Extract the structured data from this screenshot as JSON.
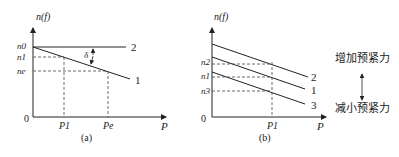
{
  "panel_a": {
    "caption": "(a)",
    "y_axis_label": "n(f)",
    "x_axis_label": "P",
    "origin_label": "0",
    "y_ticks": [
      "n0",
      "n1",
      "ne"
    ],
    "x_ticks": [
      "P1",
      "Pe"
    ],
    "lines": [
      {
        "label": "2"
      },
      {
        "label": "1"
      }
    ],
    "delta_label": "δ"
  },
  "panel_b": {
    "caption": "(b)",
    "y_axis_label": "n(f)",
    "x_axis_label": "P",
    "origin_label": "0",
    "y_ticks": [
      "n2",
      "n1",
      "n3"
    ],
    "x_ticks": [
      "P1"
    ],
    "lines": [
      {
        "label": "2"
      },
      {
        "label": "1"
      },
      {
        "label": "3"
      }
    ],
    "increase_label": "增加预紧力",
    "decrease_label": "减小预紧力"
  }
}
